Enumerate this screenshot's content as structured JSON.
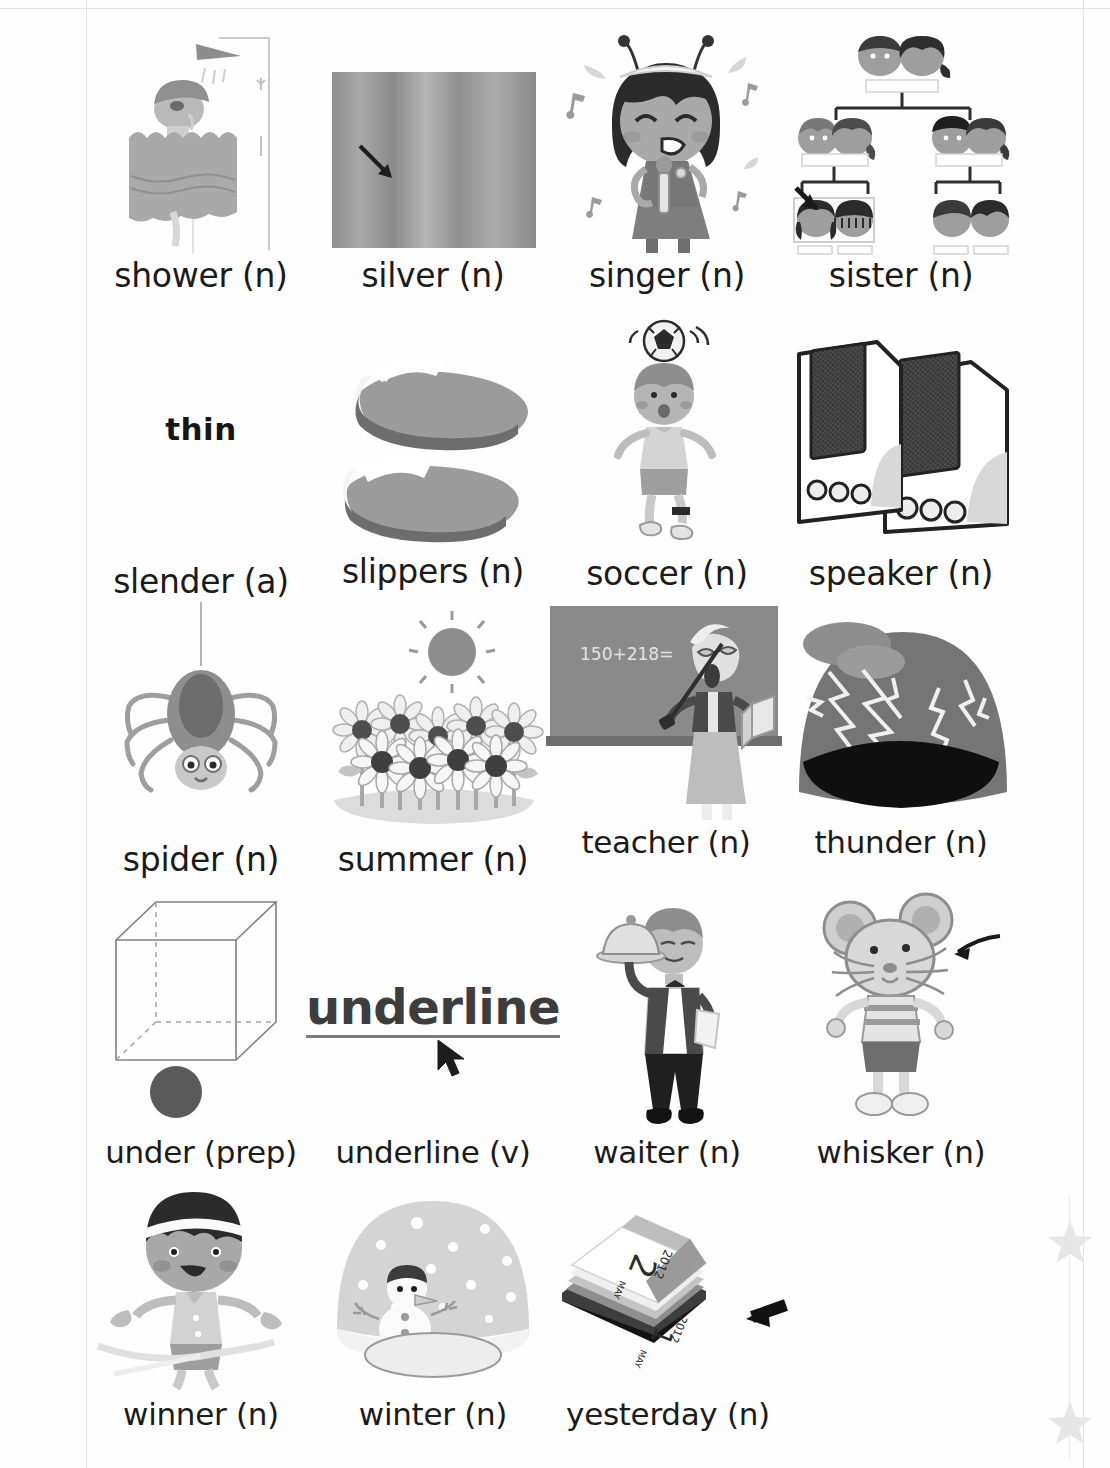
{
  "page": {
    "background_color": "#ffffff",
    "text_color": "#1b1b1b",
    "decor_color": "#e0e0e0"
  },
  "rows": [
    {
      "index": 1,
      "entries": [
        {
          "word": "shower (n)",
          "illustration": "person-in-shower-with-curtain"
        },
        {
          "word": "silver (n)",
          "illustration": "silver-metal-swatch-with-arrow"
        },
        {
          "word": "singer (n)",
          "illustration": "girl-singing-into-microphone-with-music-notes"
        },
        {
          "word": "sister (n)",
          "illustration": "family-tree-chart-with-arrow-pointing-at-sisters"
        }
      ]
    },
    {
      "index": 2,
      "entries": [
        {
          "word": "slender (a)",
          "illustration": "word-thin",
          "illustration_text": "thin"
        },
        {
          "word": "slippers (n)",
          "illustration": "pair-of-slippers"
        },
        {
          "word": "soccer (n)",
          "illustration": "boy-heading-soccer-ball"
        },
        {
          "word": "speaker (n)",
          "illustration": "two-computer-speakers"
        }
      ]
    },
    {
      "index": 3,
      "entries": [
        {
          "word": "spider (n)",
          "illustration": "spider-hanging-on-web-thread"
        },
        {
          "word": "summer (n)",
          "illustration": "sunflower-field-under-sun"
        },
        {
          "word": "teacher (n)",
          "illustration": "teacher-at-blackboard-with-pointer",
          "blackboard_text": "150+218="
        },
        {
          "word": "thunder (n)",
          "illustration": "storm-cloud-dome-with-lightning"
        }
      ]
    },
    {
      "index": 4,
      "entries": [
        {
          "word": "under (prep)",
          "illustration": "ball-under-wireframe-cube"
        },
        {
          "word": "underline (v)",
          "illustration": "underlined-word-with-cursor",
          "illustration_text": "underline"
        },
        {
          "word": "waiter (n)",
          "illustration": "waiter-carrying-covered-tray"
        },
        {
          "word": "whisker (n)",
          "illustration": "mouse-with-whiskers-and-arrow"
        }
      ]
    },
    {
      "index": 5,
      "entries": [
        {
          "word": "winner (n)",
          "illustration": "boy-crossing-finish-ribbon"
        },
        {
          "word": "winter (n)",
          "illustration": "snow-globe-with-snowman"
        },
        {
          "word": "yesterday (n)",
          "illustration": "tear-off-calendar-with-arrow",
          "calendar": {
            "year": "2012",
            "day": "2",
            "month": "MAY",
            "prev_year": "2012",
            "prev_day": "1",
            "prev_month": "MAY"
          }
        }
      ]
    }
  ],
  "decorations": {
    "stars": [
      {
        "name": "star-upper",
        "color": "#e6e6e6"
      },
      {
        "name": "star-lower",
        "color": "#e6e6e6"
      }
    ]
  }
}
